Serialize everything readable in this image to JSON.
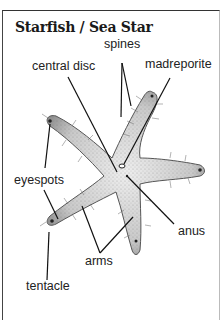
{
  "title": "Starfish / Sea Star",
  "labels": {
    "spines": "spines",
    "central_disc": "central disc",
    "madreporite": "madreporite",
    "eyespots": "eyespots",
    "anus": "anus",
    "arms": "arms",
    "tentacle": "tentacle"
  },
  "colors": {
    "ink": "#1a1a1a",
    "starfish_fill": "#d8d8d8",
    "starfish_shade": "#8a8a8a",
    "background": "#ffffff"
  }
}
